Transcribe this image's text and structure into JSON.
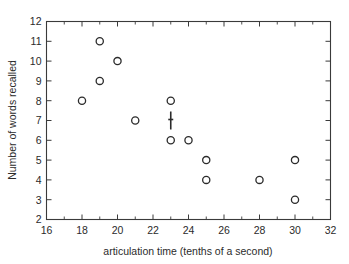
{
  "chart_data": {
    "type": "scatter",
    "title": "",
    "xlabel": "articulation time (tenths of a second)",
    "ylabel": "Number of words recalled",
    "xlim": [
      16,
      32
    ],
    "ylim": [
      2,
      12
    ],
    "grid": false,
    "legend": "none",
    "x_major_step": 2,
    "x_minor_step": 1,
    "y_major_step": 1,
    "xticks": [
      "16",
      "18",
      "20",
      "22",
      "24",
      "26",
      "28",
      "30",
      "32"
    ],
    "xtick_values": [
      16,
      18,
      20,
      22,
      24,
      26,
      28,
      30,
      32
    ],
    "yticks": [
      "2",
      "3",
      "4",
      "5",
      "6",
      "7",
      "8",
      "9",
      "10",
      "11",
      "12"
    ],
    "ytick_values": [
      2,
      3,
      4,
      5,
      6,
      7,
      8,
      9,
      10,
      11,
      12
    ],
    "series": [
      {
        "name": "observations",
        "marker": "open-circle",
        "points": [
          {
            "x": 18,
            "y": 8
          },
          {
            "x": 19,
            "y": 11
          },
          {
            "x": 19,
            "y": 9
          },
          {
            "x": 20,
            "y": 10
          },
          {
            "x": 21,
            "y": 7
          },
          {
            "x": 23,
            "y": 8
          },
          {
            "x": 23,
            "y": 6
          },
          {
            "x": 24,
            "y": 6
          },
          {
            "x": 25,
            "y": 5
          },
          {
            "x": 25,
            "y": 4
          },
          {
            "x": 28,
            "y": 4
          },
          {
            "x": 30,
            "y": 5
          },
          {
            "x": 30,
            "y": 3
          }
        ]
      },
      {
        "name": "vertical-bar-marker",
        "marker": "vertical-bar",
        "points": [
          {
            "x": 23,
            "y": 7
          }
        ]
      }
    ]
  },
  "colors": {
    "axis": "#3a3a3a",
    "marker": "#2b2b2b",
    "background": "#ffffff"
  }
}
